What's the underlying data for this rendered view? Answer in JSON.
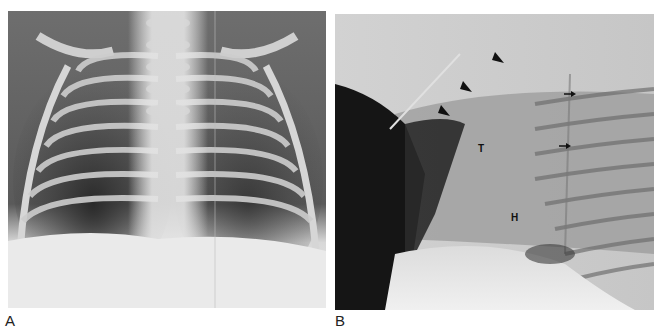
{
  "figure": {
    "panels": [
      {
        "id": "A",
        "label": "A",
        "description": "Frontal chest radiograph of infant",
        "annotations": []
      },
      {
        "id": "B",
        "label": "B",
        "description": "Lateral chest radiograph",
        "annotations": [
          {
            "type": "letter",
            "text": "T"
          },
          {
            "type": "letter",
            "text": "H"
          },
          {
            "type": "arrowhead",
            "count": 3
          },
          {
            "type": "small-arrow",
            "count": 2
          }
        ]
      }
    ],
    "annotation_letters": {
      "t": "T",
      "h": "H"
    },
    "colors": {
      "background": "#ffffff",
      "marker": "#111111"
    }
  }
}
